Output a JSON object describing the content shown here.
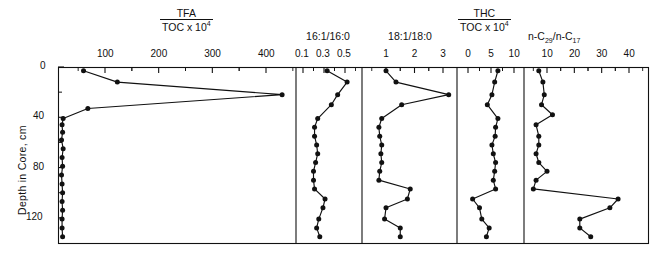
{
  "figure": {
    "y_axis_label": "Depth in Core, cm",
    "y_ticks": [
      0,
      40,
      80,
      120
    ],
    "y_range": [
      0,
      140
    ]
  },
  "panels": [
    {
      "id": "tfa",
      "title_numerator": "TFA",
      "title_denominator": "TOC  x 10",
      "title_denominator_exp": "4",
      "ticks": [
        100,
        200,
        300,
        400
      ],
      "xlim": [
        0,
        450
      ]
    },
    {
      "id": "ratio1616",
      "title": "16:1/16:0",
      "ticks": [
        0.1,
        0.3,
        0.5
      ],
      "tick_labels": [
        "0.1",
        "0.3",
        "0.5"
      ],
      "xlim": [
        0.0,
        0.62
      ]
    },
    {
      "id": "ratio1818",
      "title": "18:1/18:0",
      "ticks": [
        1,
        2,
        3
      ],
      "xlim": [
        0.3,
        3.6
      ]
    },
    {
      "id": "thc",
      "title_numerator": "THC",
      "title_denominator": "TOC x 10",
      "title_denominator_exp": "4",
      "ticks": [
        0,
        5,
        10
      ],
      "xlim": [
        -2.0,
        12.0
      ]
    },
    {
      "id": "nc29nc17",
      "title_prefix": "n-C",
      "title_sub1": "29",
      "title_mid": "/n-C",
      "title_sub2": "17",
      "ticks": [
        10,
        20,
        30,
        40
      ],
      "xlim": [
        0,
        44
      ]
    }
  ],
  "chart_data": {
    "type": "line",
    "ylabel": "Depth in Core, cm",
    "ylim": [
      0,
      140
    ],
    "y_inverted": true,
    "grid": false,
    "legend": "none",
    "panels": [
      {
        "name": "TFA/TOC x 10^4",
        "xlabel": "TFA / TOC x 10^4",
        "xlim": [
          0,
          450
        ],
        "xticks": [
          100,
          200,
          300,
          400
        ],
        "depth": [
          3,
          12,
          22,
          33,
          41,
          46,
          52,
          58,
          65,
          72,
          79,
          86,
          93,
          100,
          107,
          114,
          121,
          128,
          135
        ],
        "values": [
          60,
          123,
          430,
          68,
          22,
          20,
          21,
          19,
          22,
          20,
          21,
          19,
          20,
          21,
          20,
          21,
          20,
          20,
          21
        ]
      },
      {
        "name": "16:1/16:0",
        "xlabel": "16:1/16:0",
        "xlim": [
          0.0,
          0.62
        ],
        "xticks": [
          0.1,
          0.3,
          0.5
        ],
        "depth": [
          3,
          12,
          22,
          30,
          41,
          48,
          55,
          62,
          69,
          76,
          83,
          90,
          97,
          105,
          112,
          121,
          128,
          135
        ],
        "values": [
          0.33,
          0.52,
          0.43,
          0.37,
          0.24,
          0.21,
          0.21,
          0.23,
          0.24,
          0.22,
          0.2,
          0.2,
          0.21,
          0.31,
          0.29,
          0.25,
          0.23,
          0.26
        ]
      },
      {
        "name": "18:1/18:0",
        "xlabel": "18:1/18:0",
        "xlim": [
          0.3,
          3.6
        ],
        "xticks": [
          1,
          2,
          3
        ],
        "depth": [
          3,
          12,
          22,
          30,
          41,
          48,
          55,
          62,
          69,
          76,
          83,
          90,
          97,
          105,
          112,
          121,
          128,
          135
        ],
        "values": [
          1.0,
          1.35,
          3.2,
          1.55,
          0.85,
          0.75,
          0.78,
          0.85,
          0.82,
          0.85,
          0.78,
          0.75,
          1.85,
          1.75,
          1.0,
          0.95,
          1.5,
          1.5
        ]
      },
      {
        "name": "THC/TOC x 10^4",
        "xlabel": "THC / TOC x 10^4",
        "xlim": [
          -2.0,
          12.0
        ],
        "xticks": [
          0,
          5,
          10
        ],
        "depth": [
          3,
          12,
          22,
          30,
          41,
          48,
          55,
          62,
          69,
          76,
          83,
          90,
          97,
          105,
          112,
          121,
          128,
          135
        ],
        "values": [
          6.5,
          5.8,
          5.2,
          4.2,
          6.5,
          6.0,
          5.9,
          5.2,
          5.5,
          6.0,
          5.8,
          5.5,
          6.0,
          1.0,
          2.5,
          3.0,
          4.6,
          4.0
        ]
      },
      {
        "name": "n-C29/n-C17",
        "xlabel": "n-C29 / n-C17",
        "xlim": [
          0,
          44
        ],
        "xticks": [
          10,
          20,
          30,
          40
        ],
        "depth": [
          3,
          12,
          22,
          30,
          38,
          46,
          55,
          62,
          69,
          76,
          83,
          90,
          97,
          105,
          112,
          121,
          128,
          135
        ],
        "values": [
          7,
          8.5,
          9,
          8,
          12,
          6,
          7,
          7,
          6,
          7,
          10,
          6,
          5,
          36,
          33,
          22,
          22,
          26
        ]
      }
    ]
  }
}
